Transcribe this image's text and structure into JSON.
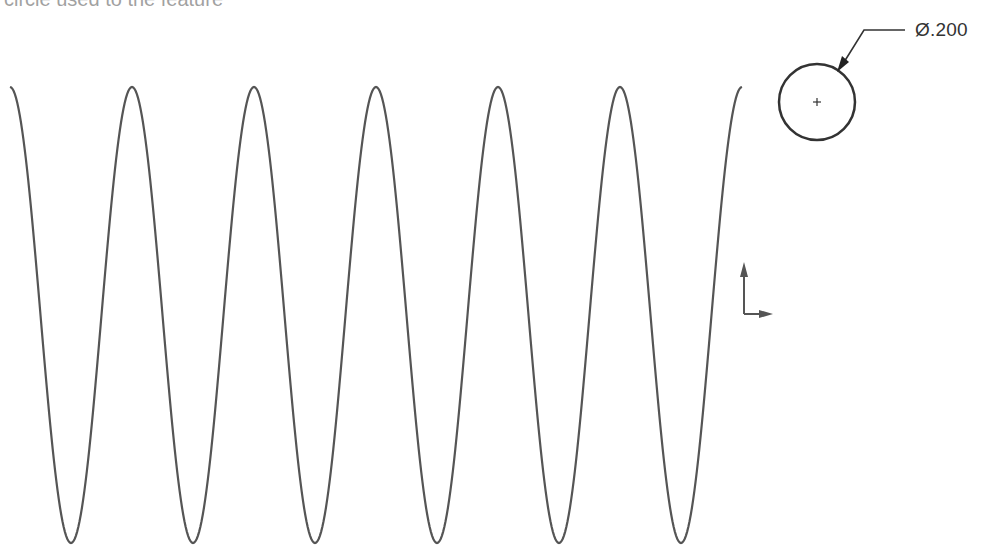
{
  "caption": {
    "text": "circle used to the feature"
  },
  "dimension": {
    "label": "Ø.200",
    "symbol": "diameter"
  },
  "drawing": {
    "wave": {
      "cycles": 6,
      "start_x": 10,
      "end_x": 742,
      "top_y": 87,
      "bottom_y": 543,
      "stroke": "#555555"
    },
    "circle": {
      "cx": 817,
      "cy": 102,
      "r": 38,
      "stroke": "#333333"
    },
    "origin_triad": {
      "x": 744,
      "y": 287,
      "color": "#555555"
    }
  }
}
